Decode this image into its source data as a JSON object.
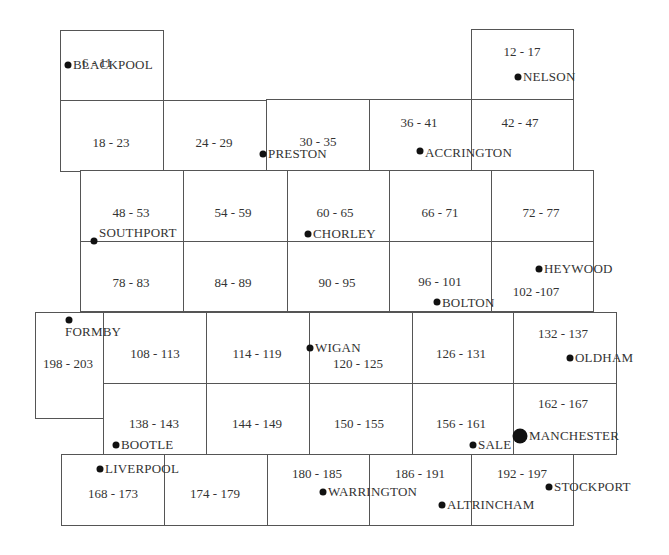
{
  "map": {
    "cells": [
      {
        "id": "c1",
        "range": "6 - 11",
        "box": [
          60,
          30,
          103,
          70
        ],
        "label": [
          97,
          63
        ]
      },
      {
        "id": "c2",
        "range": "12 - 17",
        "box": [
          471,
          29,
          102,
          71
        ],
        "label": [
          522,
          52
        ]
      },
      {
        "id": "c3",
        "range": "18 - 23",
        "box": [
          60,
          100,
          103,
          71
        ],
        "label": [
          111,
          143
        ]
      },
      {
        "id": "c4",
        "range": "24 - 29",
        "box": [
          163,
          100,
          103,
          71
        ],
        "label": [
          214,
          143
        ]
      },
      {
        "id": "c5",
        "range": "30 - 35",
        "box": [
          266,
          99,
          103,
          72
        ],
        "label": [
          318,
          142
        ]
      },
      {
        "id": "c6",
        "range": "36 - 41",
        "box": [
          369,
          99,
          102,
          72
        ],
        "label": [
          419,
          123
        ]
      },
      {
        "id": "c7",
        "range": "42 - 47",
        "box": [
          471,
          99,
          102,
          72
        ],
        "label": [
          520,
          123
        ]
      },
      {
        "id": "c8",
        "range": "48 - 53",
        "box": [
          80,
          170,
          103,
          71
        ],
        "label": [
          131,
          213
        ]
      },
      {
        "id": "c9",
        "range": "54 - 59",
        "box": [
          183,
          170,
          104,
          71
        ],
        "label": [
          233,
          213
        ]
      },
      {
        "id": "c10",
        "range": "60 - 65",
        "box": [
          287,
          170,
          102,
          71
        ],
        "label": [
          335,
          213
        ]
      },
      {
        "id": "c11",
        "range": "66 - 71",
        "box": [
          389,
          170,
          102,
          71
        ],
        "label": [
          440,
          213
        ]
      },
      {
        "id": "c12",
        "range": "72 - 77",
        "box": [
          491,
          170,
          102,
          71
        ],
        "label": [
          541,
          213
        ]
      },
      {
        "id": "c13",
        "range": "78 - 83",
        "box": [
          80,
          241,
          103,
          70
        ],
        "label": [
          131,
          283
        ]
      },
      {
        "id": "c14",
        "range": "84 - 89",
        "box": [
          183,
          241,
          104,
          70
        ],
        "label": [
          233,
          283
        ]
      },
      {
        "id": "c15",
        "range": "90 - 95",
        "box": [
          287,
          241,
          102,
          70
        ],
        "label": [
          337,
          283
        ]
      },
      {
        "id": "c16",
        "range": "96 - 101",
        "box": [
          389,
          241,
          102,
          70
        ],
        "label": [
          440,
          282
        ]
      },
      {
        "id": "c17",
        "range": "102 -107",
        "box": [
          491,
          241,
          102,
          70
        ],
        "label": [
          536,
          292
        ]
      },
      {
        "id": "c18",
        "range": "198 - 203",
        "box": [
          35,
          312,
          68,
          106
        ],
        "label": [
          68,
          364
        ]
      },
      {
        "id": "c19",
        "range": "108 - 113",
        "box": [
          103,
          312,
          103,
          71
        ],
        "label": [
          155,
          354
        ]
      },
      {
        "id": "c20",
        "range": "114 - 119",
        "box": [
          206,
          312,
          103,
          71
        ],
        "label": [
          257,
          354
        ]
      },
      {
        "id": "c21",
        "range": "120 - 125",
        "box": [
          309,
          312,
          103,
          71
        ],
        "label": [
          358,
          364
        ]
      },
      {
        "id": "c22",
        "range": "126 - 131",
        "box": [
          412,
          312,
          101,
          71
        ],
        "label": [
          461,
          354
        ]
      },
      {
        "id": "c23",
        "range": "132 - 137",
        "box": [
          513,
          312,
          103,
          71
        ],
        "label": [
          563,
          334
        ]
      },
      {
        "id": "c24",
        "range": "138 - 143",
        "box": [
          103,
          383,
          103,
          71
        ],
        "label": [
          154,
          424
        ]
      },
      {
        "id": "c25",
        "range": "144 - 149",
        "box": [
          206,
          383,
          103,
          71
        ],
        "label": [
          257,
          424
        ]
      },
      {
        "id": "c26",
        "range": "150 - 155",
        "box": [
          309,
          383,
          103,
          71
        ],
        "label": [
          359,
          424
        ]
      },
      {
        "id": "c27",
        "range": "156 - 161",
        "box": [
          412,
          383,
          101,
          71
        ],
        "label": [
          461,
          424
        ]
      },
      {
        "id": "c28",
        "range": "162 - 167",
        "box": [
          513,
          383,
          103,
          71
        ],
        "label": [
          563,
          404
        ]
      },
      {
        "id": "c29",
        "range": "168 - 173",
        "box": [
          61,
          454,
          103,
          71
        ],
        "label": [
          113,
          494
        ]
      },
      {
        "id": "c30",
        "range": "174 - 179",
        "box": [
          164,
          454,
          103,
          71
        ],
        "label": [
          215,
          494
        ]
      },
      {
        "id": "c31",
        "range": "180 - 185",
        "box": [
          267,
          454,
          102,
          71
        ],
        "label": [
          317,
          474
        ]
      },
      {
        "id": "c32",
        "range": "186 - 191",
        "box": [
          369,
          454,
          102,
          71
        ],
        "label": [
          420,
          474
        ]
      },
      {
        "id": "c33",
        "range": "192 - 197",
        "box": [
          471,
          454,
          102,
          71
        ],
        "label": [
          522,
          474
        ]
      }
    ],
    "towns": [
      {
        "name": "BLACKPOOL",
        "dot": [
          68,
          65
        ],
        "text": [
          73,
          58
        ],
        "major": false
      },
      {
        "name": "NELSON",
        "dot": [
          518,
          77
        ],
        "text": [
          523,
          70
        ],
        "major": false
      },
      {
        "name": "PRESTON",
        "dot": [
          263,
          154
        ],
        "text": [
          268,
          147
        ],
        "major": false
      },
      {
        "name": "ACCRINGTON",
        "dot": [
          420,
          151
        ],
        "text": [
          425,
          146
        ],
        "major": false
      },
      {
        "name": "SOUTHPORT",
        "dot": [
          94,
          241
        ],
        "text": [
          99,
          226
        ],
        "major": false
      },
      {
        "name": "CHORLEY",
        "dot": [
          308,
          234
        ],
        "text": [
          313,
          227
        ],
        "major": false
      },
      {
        "name": "HEYWOOD",
        "dot": [
          539,
          269
        ],
        "text": [
          544,
          262
        ],
        "major": false
      },
      {
        "name": "BOLTON",
        "dot": [
          437,
          302
        ],
        "text": [
          442,
          296
        ],
        "major": false
      },
      {
        "name": "FORMBY",
        "dot": [
          69,
          320
        ],
        "text": [
          65,
          325
        ],
        "major": false
      },
      {
        "name": "WIGAN",
        "dot": [
          310,
          348
        ],
        "text": [
          315,
          341
        ],
        "major": false
      },
      {
        "name": "OLDHAM",
        "dot": [
          570,
          358
        ],
        "text": [
          575,
          351
        ],
        "major": false
      },
      {
        "name": "BOOTLE",
        "dot": [
          116,
          445
        ],
        "text": [
          121,
          438
        ],
        "major": false
      },
      {
        "name": "SALE",
        "dot": [
          473,
          445
        ],
        "text": [
          478,
          438
        ],
        "major": false
      },
      {
        "name": "MANCHESTER",
        "dot": [
          520,
          436
        ],
        "text": [
          529,
          429
        ],
        "major": true
      },
      {
        "name": "LIVERPOOL",
        "dot": [
          100,
          469
        ],
        "text": [
          105,
          462
        ],
        "major": false
      },
      {
        "name": "WARRINGTON",
        "dot": [
          323,
          492
        ],
        "text": [
          328,
          485
        ],
        "major": false
      },
      {
        "name": "ALTRINCHAM",
        "dot": [
          442,
          505
        ],
        "text": [
          447,
          498
        ],
        "major": false
      },
      {
        "name": "STOCKPORT",
        "dot": [
          549,
          487
        ],
        "text": [
          554,
          480
        ],
        "major": false
      }
    ]
  }
}
